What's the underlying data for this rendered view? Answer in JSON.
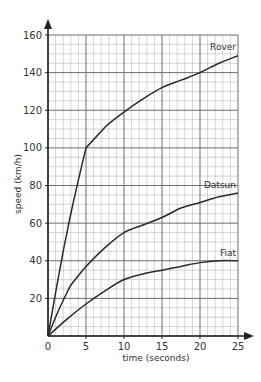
{
  "chart_data": {
    "type": "line",
    "title": "",
    "xlabel": "time (seconds)",
    "ylabel": "speed (km/h)",
    "xlim": [
      0,
      25
    ],
    "ylim": [
      0,
      160
    ],
    "x_ticks": [
      0,
      5,
      10,
      15,
      20,
      25
    ],
    "y_ticks": [
      20,
      40,
      60,
      80,
      100,
      120,
      140,
      160
    ],
    "x_tick_labels": [
      "0",
      "5",
      "10",
      "15",
      "20",
      "25"
    ],
    "y_tick_labels": [
      "20",
      "40",
      "60",
      "80",
      "100",
      "120",
      "140",
      "160"
    ],
    "grid": {
      "on": true,
      "minor_x_step": 1,
      "minor_y_step": 5,
      "major_x_step": 5,
      "major_y_step": 20
    },
    "legend": {
      "position": "inline labels at right end of each curve"
    },
    "series": [
      {
        "name": "Rover",
        "x": [
          0,
          1,
          2,
          2.5,
          3,
          4,
          5,
          7.5,
          10,
          12.5,
          15,
          17.5,
          20,
          22.5,
          25
        ],
        "values": [
          0,
          23,
          45,
          55,
          65,
          83,
          100,
          111,
          119,
          126,
          132,
          136,
          140,
          145,
          149
        ]
      },
      {
        "name": "Datsun",
        "x": [
          0,
          1,
          2,
          2.5,
          3,
          4,
          5,
          7.5,
          10,
          12.5,
          15,
          17.5,
          20,
          22.5,
          25
        ],
        "values": [
          0,
          10,
          19,
          23,
          27,
          32,
          37,
          47,
          55,
          59,
          63,
          68,
          71,
          74,
          76
        ]
      },
      {
        "name": "Fiat",
        "x": [
          0,
          2.5,
          5,
          7.5,
          10,
          12.5,
          15,
          17.5,
          20,
          22.5,
          25
        ],
        "values": [
          0,
          9,
          17,
          24,
          30,
          33,
          35,
          37,
          39,
          40,
          40
        ]
      }
    ]
  },
  "colors": {
    "grid_minor": "#b8b8b8",
    "grid_major": "#6e6e6e",
    "axis": "#222222",
    "curve": "#2a2a2a",
    "text": "#333333"
  }
}
